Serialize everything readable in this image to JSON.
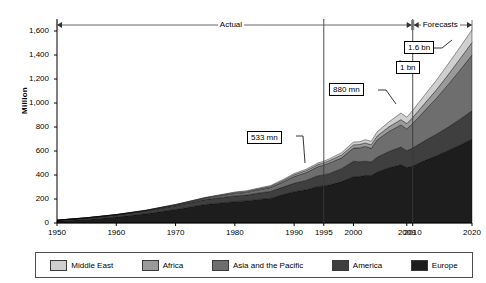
{
  "chart_data": {
    "type": "area",
    "stacked": true,
    "title": "",
    "subtitle": "",
    "xlabel": "",
    "ylabel": "Million",
    "ylim": [
      0,
      1600
    ],
    "xlim": [
      1950,
      2020
    ],
    "yticks": [
      "0",
      "200",
      "400",
      "600",
      "800",
      "1,000",
      "1,200",
      "1,400",
      "1,600"
    ],
    "ytick_values": [
      0,
      200,
      400,
      600,
      800,
      1000,
      1200,
      1400,
      1600
    ],
    "xticks": [
      "1950",
      "1960",
      "1970",
      "1980",
      "1990",
      "1995",
      "2000",
      "2009",
      "2010",
      "2020"
    ],
    "xtick_values": [
      1950,
      1960,
      1970,
      1980,
      1990,
      1995,
      2000,
      2009,
      2010,
      2020
    ],
    "grid": false,
    "legend_position": "bottom",
    "x": [
      1950,
      1955,
      1960,
      1965,
      1970,
      1975,
      1980,
      1982,
      1984,
      1986,
      1988,
      1990,
      1992,
      1994,
      1995,
      1996,
      1998,
      2000,
      2001,
      2002,
      2003,
      2004,
      2006,
      2008,
      2009,
      2010,
      2012,
      2014,
      2016,
      2018,
      2020
    ],
    "series": [
      {
        "name": "Europe",
        "color": "#1d1d1d",
        "values": [
          16,
          30,
          50,
          77,
          113,
          154,
          178,
          184,
          196,
          205,
          235,
          261,
          277,
          305,
          309,
          318,
          345,
          386,
          388,
          397,
          396,
          424,
          461,
          485,
          462,
          475,
          520,
          560,
          605,
          650,
          700
        ]
      },
      {
        "name": "America",
        "color": "#3f3f3f",
        "values": [
          7,
          12,
          17,
          23,
          31,
          41,
          48,
          49,
          54,
          58,
          62,
          70,
          78,
          89,
          92,
          95,
          108,
          128,
          123,
          117,
          113,
          124,
          135,
          148,
          140,
          150,
          165,
          180,
          195,
          215,
          235
        ]
      },
      {
        "name": "Asia and the Pacific",
        "color": "#6e6e6e",
        "values": [
          0.2,
          0.8,
          1.5,
          3,
          6,
          10,
          20,
          22,
          26,
          32,
          42,
          56,
          64,
          75,
          81,
          88,
          90,
          110,
          115,
          124,
          113,
          144,
          167,
          184,
          181,
          204,
          250,
          300,
          355,
          410,
          465
        ]
      },
      {
        "name": "Africa",
        "color": "#9a9a9a",
        "values": [
          0.5,
          1,
          1.5,
          2.5,
          3,
          5,
          7,
          8,
          8.5,
          9.5,
          12,
          15,
          17,
          18,
          19,
          20,
          24,
          27,
          28,
          29,
          30,
          33,
          39,
          44,
          46,
          50,
          60,
          70,
          82,
          94,
          105
        ]
      },
      {
        "name": "Middle East",
        "color": "#cfcfcf",
        "values": [
          0.2,
          0.4,
          0.6,
          1.5,
          2,
          3,
          5,
          6,
          6.5,
          7,
          8,
          10,
          11,
          13,
          14,
          15,
          19,
          24,
          23,
          27,
          29,
          35,
          41,
          55,
          53,
          60,
          70,
          80,
          90,
          98,
          105
        ]
      }
    ],
    "totals_note": [
      {
        "year": 1995,
        "label": "533 mn"
      },
      {
        "year": 2009,
        "label": "880 mn"
      },
      {
        "year": 2010,
        "label": "1 bn"
      },
      {
        "year": 2020,
        "label": "1.6 bn"
      }
    ],
    "annotations": [
      {
        "name": "callout-533",
        "text": "533 mn"
      },
      {
        "name": "callout-880",
        "text": "880 mn"
      },
      {
        "name": "callout-1bn",
        "text": "1 bn"
      },
      {
        "name": "callout-16bn",
        "text": "1.6 bn"
      }
    ],
    "period_bands": [
      {
        "name": "actual",
        "label": "Actual",
        "from": 1950,
        "to": 2010
      },
      {
        "name": "forecasts",
        "label": "Forecasts",
        "from": 2010,
        "to": 2020
      }
    ],
    "reference_lines": [
      1995,
      2010
    ]
  },
  "axis": {
    "y_title": "Million",
    "y_ticks": [
      "1,600",
      "1,400",
      "1,200",
      "1,000",
      "800",
      "600",
      "400",
      "200",
      "0"
    ],
    "x_ticks": [
      "1950",
      "1960",
      "1970",
      "1980",
      "1990",
      "1995",
      "2000",
      "2009",
      "2010",
      "2020"
    ]
  },
  "periods": {
    "actual_label": "Actual",
    "forecasts_label": "Forecasts"
  },
  "callouts": {
    "c533": "533 mn",
    "c880": "880 mn",
    "c1bn": "1 bn",
    "c16bn": "1.6 bn"
  },
  "legend": {
    "items": [
      {
        "label": "Middle East",
        "color": "#cfcfcf"
      },
      {
        "label": "Africa",
        "color": "#9a9a9a"
      },
      {
        "label": "Asia and the Pacific",
        "color": "#6e6e6e"
      },
      {
        "label": "America",
        "color": "#3f3f3f"
      },
      {
        "label": "Europe",
        "color": "#1d1d1d"
      }
    ]
  }
}
